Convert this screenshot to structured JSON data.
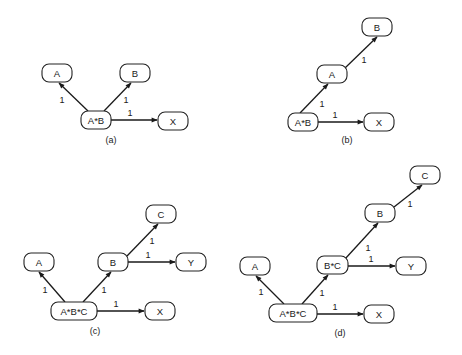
{
  "figure": {
    "panels": [
      {
        "id": "a",
        "caption": "(a)",
        "caption_pos": [
          111,
          140
        ],
        "nodes": [
          {
            "id": "A",
            "label": "A",
            "x": 42,
            "y": 64,
            "w": 30,
            "h": 18
          },
          {
            "id": "B",
            "label": "B",
            "x": 120,
            "y": 64,
            "w": 30,
            "h": 18
          },
          {
            "id": "AB",
            "label": "A*B",
            "x": 81,
            "y": 111,
            "w": 30,
            "h": 18
          },
          {
            "id": "X",
            "label": "X",
            "x": 158,
            "y": 112,
            "w": 30,
            "h": 18
          }
        ],
        "edges": [
          {
            "from": "AB",
            "to": "A",
            "weight": "1",
            "x1": 88,
            "y1": 111,
            "x2": 59,
            "y2": 83,
            "lx": 62,
            "ly": 100
          },
          {
            "from": "AB",
            "to": "B",
            "weight": "1",
            "x1": 104,
            "y1": 111,
            "x2": 131,
            "y2": 83,
            "lx": 126,
            "ly": 100
          },
          {
            "from": "AB",
            "to": "X",
            "weight": "1",
            "x1": 111,
            "y1": 120,
            "x2": 157,
            "y2": 120,
            "lx": 130,
            "ly": 113
          }
        ]
      },
      {
        "id": "b",
        "caption": "(b)",
        "caption_pos": [
          347,
          140
        ],
        "nodes": [
          {
            "id": "B",
            "label": "B",
            "x": 362,
            "y": 18,
            "w": 30,
            "h": 18
          },
          {
            "id": "A",
            "label": "A",
            "x": 317,
            "y": 65,
            "w": 30,
            "h": 18
          },
          {
            "id": "AB",
            "label": "A*B",
            "x": 288,
            "y": 113,
            "w": 30,
            "h": 18
          },
          {
            "id": "X",
            "label": "X",
            "x": 364,
            "y": 113,
            "w": 30,
            "h": 18
          }
        ],
        "edges": [
          {
            "from": "A",
            "to": "B",
            "weight": "1",
            "x1": 345,
            "y1": 68,
            "x2": 377,
            "y2": 37,
            "lx": 364,
            "ly": 60
          },
          {
            "from": "AB",
            "to": "A",
            "weight": "1",
            "x1": 300,
            "y1": 113,
            "x2": 328,
            "y2": 84,
            "lx": 322,
            "ly": 104
          },
          {
            "from": "AB",
            "to": "X",
            "weight": "1",
            "x1": 318,
            "y1": 122,
            "x2": 363,
            "y2": 122,
            "lx": 335,
            "ly": 115
          }
        ]
      },
      {
        "id": "c",
        "caption": "(c)",
        "caption_pos": [
          95,
          331
        ],
        "nodes": [
          {
            "id": "C",
            "label": "C",
            "x": 146,
            "y": 205,
            "w": 30,
            "h": 18
          },
          {
            "id": "A",
            "label": "A",
            "x": 24,
            "y": 253,
            "w": 30,
            "h": 18
          },
          {
            "id": "B",
            "label": "B",
            "x": 98,
            "y": 253,
            "w": 30,
            "h": 18
          },
          {
            "id": "Y",
            "label": "Y",
            "x": 176,
            "y": 253,
            "w": 30,
            "h": 18
          },
          {
            "id": "ABC",
            "label": "A*B*C",
            "x": 51,
            "y": 302,
            "w": 46,
            "h": 18
          },
          {
            "id": "X",
            "label": "X",
            "x": 145,
            "y": 302,
            "w": 30,
            "h": 18
          }
        ],
        "edges": [
          {
            "from": "B",
            "to": "C",
            "weight": "1",
            "x1": 127,
            "y1": 256,
            "x2": 158,
            "y2": 224,
            "lx": 152,
            "ly": 241
          },
          {
            "from": "B",
            "to": "Y",
            "weight": "1",
            "x1": 128,
            "y1": 262,
            "x2": 175,
            "y2": 262,
            "lx": 148,
            "ly": 255
          },
          {
            "from": "ABC",
            "to": "A",
            "weight": "1",
            "x1": 65,
            "y1": 302,
            "x2": 39,
            "y2": 272,
            "lx": 45,
            "ly": 290
          },
          {
            "from": "ABC",
            "to": "B",
            "weight": "1",
            "x1": 83,
            "y1": 302,
            "x2": 111,
            "y2": 272,
            "lx": 104,
            "ly": 290
          },
          {
            "from": "ABC",
            "to": "X",
            "weight": "1",
            "x1": 97,
            "y1": 311,
            "x2": 144,
            "y2": 311,
            "lx": 116,
            "ly": 304
          }
        ]
      },
      {
        "id": "d",
        "caption": "(d)",
        "caption_pos": [
          340,
          333
        ],
        "nodes": [
          {
            "id": "C",
            "label": "C",
            "x": 410,
            "y": 166,
            "w": 30,
            "h": 18
          },
          {
            "id": "B",
            "label": "B",
            "x": 365,
            "y": 204,
            "w": 30,
            "h": 18
          },
          {
            "id": "A",
            "label": "A",
            "x": 240,
            "y": 257,
            "w": 30,
            "h": 18
          },
          {
            "id": "BC",
            "label": "B*C",
            "x": 317,
            "y": 256,
            "w": 31,
            "h": 18
          },
          {
            "id": "Y",
            "label": "Y",
            "x": 396,
            "y": 257,
            "w": 30,
            "h": 18
          },
          {
            "id": "ABC",
            "label": "A*B*C",
            "x": 269,
            "y": 304,
            "w": 48,
            "h": 18
          },
          {
            "id": "X",
            "label": "X",
            "x": 364,
            "y": 305,
            "w": 30,
            "h": 18
          }
        ],
        "edges": [
          {
            "from": "B",
            "to": "C",
            "weight": "1",
            "x1": 394,
            "y1": 207,
            "x2": 422,
            "y2": 185,
            "lx": 410,
            "ly": 204
          },
          {
            "from": "BC",
            "to": "B",
            "weight": "1",
            "x1": 345,
            "y1": 259,
            "x2": 378,
            "y2": 223,
            "lx": 368,
            "ly": 248
          },
          {
            "from": "BC",
            "to": "Y",
            "weight": "1",
            "x1": 348,
            "y1": 266,
            "x2": 395,
            "y2": 266,
            "lx": 371,
            "ly": 259
          },
          {
            "from": "ABC",
            "to": "A",
            "weight": "1",
            "x1": 284,
            "y1": 304,
            "x2": 256,
            "y2": 276,
            "lx": 261,
            "ly": 292
          },
          {
            "from": "ABC",
            "to": "BC",
            "weight": "1",
            "x1": 302,
            "y1": 304,
            "x2": 328,
            "y2": 275,
            "lx": 322,
            "ly": 293
          },
          {
            "from": "ABC",
            "to": "X",
            "weight": "1",
            "x1": 317,
            "y1": 314,
            "x2": 363,
            "y2": 314,
            "lx": 335,
            "ly": 307
          }
        ]
      }
    ]
  }
}
